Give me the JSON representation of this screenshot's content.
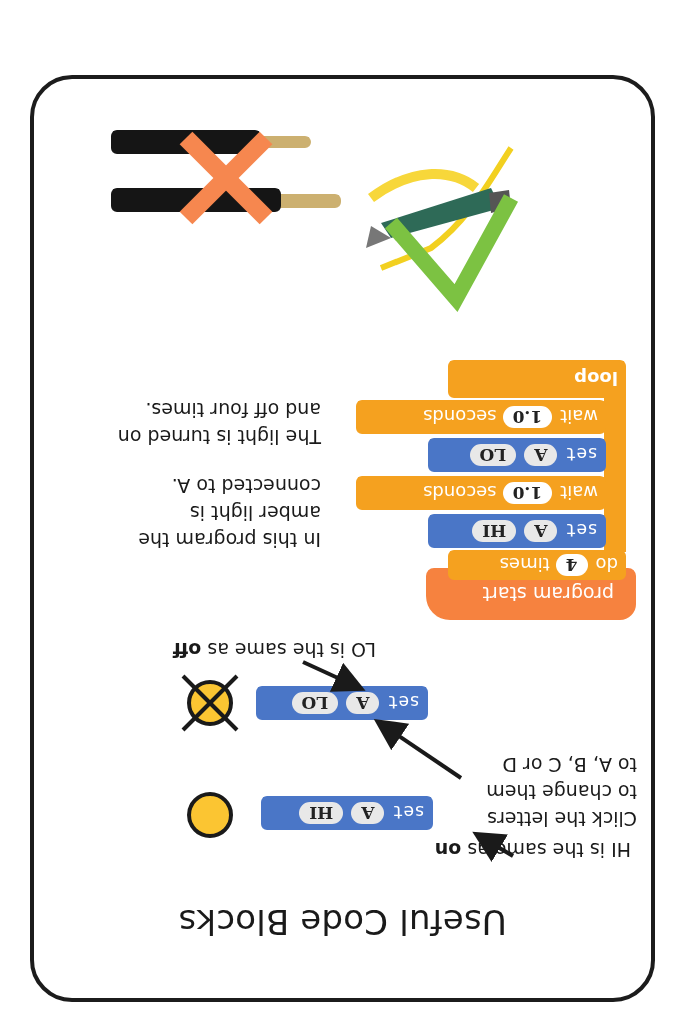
{
  "card": {
    "title": "Useful Code Blocks",
    "section1": {
      "hi_note_prefix": "HI is the same as ",
      "hi_note_bold": "on",
      "click_note_lines": [
        "Click the letters",
        "to change them",
        "to A, B, C or D"
      ],
      "lo_note_prefix": "LO is the same as ",
      "lo_note_bold": "off",
      "hi_block": {
        "keyword": "set",
        "pin": "A",
        "state": "HI"
      },
      "lo_block": {
        "keyword": "set",
        "pin": "A",
        "state": "LO"
      },
      "lamp_on": "lamp-on-icon",
      "lamp_off": "lamp-off-icon"
    },
    "section2": {
      "program": {
        "start": "program start",
        "do_label": "do",
        "do_count": "4",
        "times_label": "times",
        "steps": [
          {
            "keyword": "set",
            "pin": "A",
            "state": "HI"
          },
          {
            "keyword": "wait",
            "value": "1.0",
            "unit": "seconds"
          },
          {
            "keyword": "set",
            "pin": "A",
            "state": "LO"
          },
          {
            "keyword": "wait",
            "value": "1.0",
            "unit": "seconds"
          }
        ],
        "loop_label": "loop"
      },
      "description_lines": [
        "In this program the",
        "amber light is",
        "connected to A.",
        "",
        "The light is turned on",
        "and off four times."
      ]
    },
    "section3": {
      "crocodile_clips": "crocodile-clip-image",
      "correct_mark": "check-icon",
      "audio_jacks": "audio-jack-image",
      "wrong_mark": "cross-icon"
    },
    "colors": {
      "set_block": "#4a76c7",
      "wait_block": "#f5a11f",
      "start_block": "#f6823f",
      "lamp": "#fbc532",
      "check": "#7cc242",
      "cross": "#f6874f"
    }
  }
}
